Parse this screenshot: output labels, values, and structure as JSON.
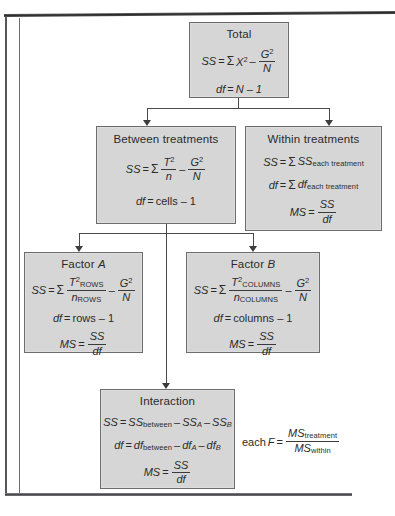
{
  "diagram": {
    "title_semantic": "two-factor-anova-structure",
    "box_fill": "#d6d6d6",
    "box_border": "#6d6d70",
    "line_color": "#4a4a4c",
    "nodes": {
      "total": {
        "title": "Total",
        "ss_lhs": "SS",
        "ss_eq": "=",
        "ss_sigma": "Σ",
        "ss_term1_base": "X",
        "ss_term1_sup": "2",
        "ss_minus": "–",
        "ss_num_base": "G",
        "ss_num_sup": "2",
        "ss_den": "N",
        "df_lhs": "df",
        "df_rhs": "N – 1"
      },
      "between": {
        "title": "Between treatments",
        "ss_lhs": "SS",
        "ss_sigma": "Σ",
        "ss_num_base": "T",
        "ss_num_sup": "2",
        "ss_den": "n",
        "ss_minus": "–",
        "ss_num2_base": "G",
        "ss_num2_sup": "2",
        "ss_den2": "N",
        "df_lhs": "df",
        "df_rhs": "cells – 1"
      },
      "within": {
        "title": "Within treatments",
        "ss_lhs": "SS",
        "ss_sigma": "Σ",
        "ss_term": "SS",
        "ss_sub": "each treatment",
        "df_lhs": "df",
        "df_sigma": "Σ",
        "df_term": "df",
        "df_sub": "each treatment",
        "ms_lhs": "MS",
        "ms_num": "SS",
        "ms_den": "df"
      },
      "factor_a": {
        "title_prefix": "Factor ",
        "title_letter": "A",
        "ss_lhs": "SS",
        "ss_sigma": "Σ",
        "ss_num_base": "T",
        "ss_num_sup": "2",
        "ss_num_sub": "ROWS",
        "ss_den_base": "n",
        "ss_den_sub": "ROWS",
        "ss_minus": "–",
        "ss_num2_base": "G",
        "ss_num2_sup": "2",
        "ss_den2": "N",
        "df_lhs": "df",
        "df_rhs": "rows – 1",
        "ms_lhs": "MS",
        "ms_num": "SS",
        "ms_den": "df"
      },
      "factor_b": {
        "title_prefix": "Factor ",
        "title_letter": "B",
        "ss_lhs": "SS",
        "ss_sigma": "Σ",
        "ss_num_base": "T",
        "ss_num_sup": "2",
        "ss_num_sub": "COLUMNS",
        "ss_den_base": "n",
        "ss_den_sub": "COLUMNS",
        "ss_minus": "–",
        "ss_num2_base": "G",
        "ss_num2_sup": "2",
        "ss_den2": "N",
        "df_lhs": "df",
        "df_rhs": "columns – 1",
        "ms_lhs": "MS",
        "ms_num": "SS",
        "ms_den": "df"
      },
      "interaction": {
        "title": "Interaction",
        "ss_lhs": "SS",
        "ss_t1": "SS",
        "ss_t1_sub": "between",
        "ss_minus1": "–",
        "ss_t2": "SS",
        "ss_t2_sub": "A",
        "ss_minus2": "–",
        "ss_t3": "SS",
        "ss_t3_sub": "B",
        "df_lhs": "df",
        "df_t1": "df",
        "df_t1_sub": "between",
        "df_minus1": "–",
        "df_t2": "df",
        "df_t2_sub": "A",
        "df_minus2": "–",
        "df_t3": "df",
        "df_t3_sub": "B",
        "ms_lhs": "MS",
        "ms_num": "SS",
        "ms_den": "df"
      }
    },
    "f_ratio": {
      "prefix": "each ",
      "symbol": "F",
      "eq": "=",
      "num_base": "MS",
      "num_sub": "treatment",
      "den_base": "MS",
      "den_sub": "within"
    },
    "equals": "="
  }
}
